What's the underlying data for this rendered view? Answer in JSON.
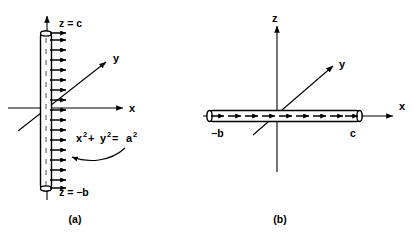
{
  "figure": {
    "background_color": "#ffffff",
    "ink_color": "#000000",
    "panels": [
      {
        "id": "a",
        "caption": "(a)",
        "description": "charged cylindrical shell along z axis with radial outward field arrows",
        "axes": [
          {
            "name": "x-axis",
            "label": "x"
          },
          {
            "name": "y-axis",
            "label": "y"
          },
          {
            "name": "z-axis",
            "label": ""
          }
        ],
        "annotations": {
          "top_end_label": "z = c",
          "bottom_end_label": "z = −b",
          "equation_base": "x",
          "equation_exp1": "2",
          "equation_plus": " + ",
          "equation_var2": "y",
          "equation_exp2": "2",
          "equation_equals": " = ",
          "equation_var3": "a",
          "equation_exp3": "2",
          "equation_full": "x2 + y2 = a2"
        },
        "arrow_count": 16,
        "arrow_direction": "right"
      },
      {
        "id": "b",
        "caption": "(b)",
        "description": "line charge along x axis from -b to c with arrows pointing in +x direction",
        "axes": [
          {
            "name": "x-axis",
            "label": "x"
          },
          {
            "name": "y-axis",
            "label": "y"
          },
          {
            "name": "z-axis",
            "label": "z"
          }
        ],
        "annotations": {
          "left_end_label": "−b",
          "right_end_label": "c"
        },
        "arrow_count": 12,
        "arrow_direction": "right"
      }
    ]
  }
}
